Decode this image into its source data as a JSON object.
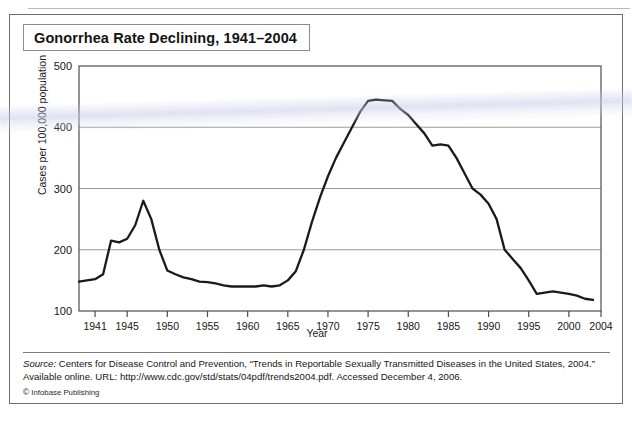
{
  "figure": {
    "title": "Gonorrhea Rate Declining, 1941–2004",
    "credit_mark": "©",
    "credit": "Infobase Publishing",
    "source_label": "Source:",
    "source_text": " Centers for Disease Control and Prevention, “Trends in Reportable Sexually Transmitted Diseases in the United States, 2004.” Available online. URL: http://www.cdc.gov/std/stats/04pdf/trends2004.pdf.  Accessed December 4, 2006."
  },
  "colors": {
    "line": "#1a1a1a",
    "grid": "#9c9c9e",
    "frame": "#4d4d4f",
    "text": "#161616",
    "panel_border": "#6e6e70"
  },
  "chart_data": {
    "type": "line",
    "title": "Gonorrhea Rate Declining, 1941–2004",
    "xlabel": "Year",
    "ylabel": "Cases per 100,000 population",
    "xlim": [
      1939,
      2004
    ],
    "ylim": [
      100,
      500
    ],
    "ytick_values": [
      100,
      200,
      300,
      400,
      500
    ],
    "ytick_labels": [
      "100",
      "200",
      "300",
      "400",
      "500"
    ],
    "xtick_values": [
      1941,
      1945,
      1950,
      1955,
      1960,
      1965,
      1970,
      1975,
      1980,
      1985,
      1990,
      1995,
      2000,
      2004
    ],
    "xtick_labels": [
      "1941",
      "1945",
      "1950",
      "1955",
      "1960",
      "1965",
      "1970",
      "1975",
      "1980",
      "1985",
      "1990",
      "1995",
      "2000",
      "2004"
    ],
    "grid": "horizontal gridlines at 200, 300, 400",
    "legend": "none",
    "series": [
      {
        "name": "Gonorrhea rate (cases per 100,000 population)",
        "x": [
          1939,
          1941,
          1942,
          1943,
          1944,
          1945,
          1946,
          1947,
          1948,
          1949,
          1950,
          1951,
          1952,
          1953,
          1954,
          1955,
          1956,
          1957,
          1958,
          1959,
          1960,
          1961,
          1962,
          1963,
          1964,
          1965,
          1966,
          1967,
          1968,
          1969,
          1970,
          1971,
          1972,
          1973,
          1974,
          1975,
          1976,
          1977,
          1978,
          1979,
          1980,
          1981,
          1982,
          1983,
          1984,
          1985,
          1986,
          1987,
          1988,
          1989,
          1990,
          1991,
          1992,
          1993,
          1994,
          1995,
          1996,
          1997,
          1998,
          1999,
          2000,
          2001,
          2002,
          2003
        ],
        "y": [
          148,
          152,
          160,
          215,
          212,
          218,
          240,
          280,
          250,
          200,
          166,
          160,
          155,
          152,
          148,
          147,
          145,
          142,
          140,
          140,
          140,
          140,
          142,
          140,
          142,
          150,
          165,
          200,
          245,
          285,
          320,
          350,
          375,
          400,
          425,
          443,
          445,
          444,
          443,
          430,
          420,
          405,
          390,
          370,
          372,
          370,
          350,
          325,
          300,
          290,
          275,
          250,
          200,
          185,
          170,
          150,
          128,
          130,
          132,
          130,
          128,
          125,
          120,
          118
        ],
        "style": "solid black line, no markers, ~2.2px"
      }
    ],
    "annotations": [
      {
        "text": "wartime peak",
        "x": 1947,
        "y": 280
      },
      {
        "text": "1975 peak",
        "x": 1975,
        "y": 443
      },
      {
        "text": "modern low",
        "x": 2003,
        "y": 118
      }
    ]
  }
}
